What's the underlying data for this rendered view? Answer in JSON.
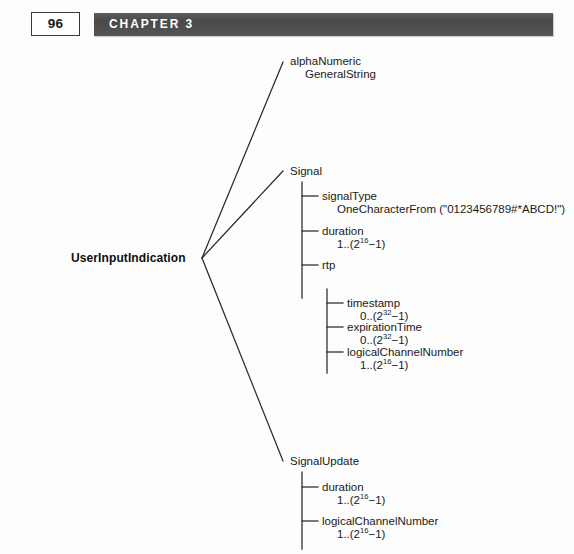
{
  "page": {
    "folio": "96",
    "chapter": "CHAPTER 3",
    "bar_color": "#4f4f4f",
    "background": "#fdfdfd",
    "ink": "#1a1a1a"
  },
  "tree": {
    "root": {
      "label": "UserInputIndication"
    },
    "branches": [
      {
        "name": "alphaNumeric",
        "label": "alphaNumeric",
        "value": "GeneralString"
      },
      {
        "name": "signal",
        "label": "Signal",
        "children": [
          {
            "name": "signalType",
            "label": "signalType",
            "value": "OneCharacterFrom (\"0123456789#*ABCD!\")"
          },
          {
            "name": "duration",
            "label": "duration",
            "value_prefix": "1..(2",
            "value_exp": "16",
            "value_suffix": "−1)"
          },
          {
            "name": "rtp",
            "label": "rtp",
            "children": [
              {
                "name": "timestamp",
                "label": "timestamp",
                "value_prefix": "0..(2",
                "value_exp": "32",
                "value_suffix": "−1)"
              },
              {
                "name": "expirationTime",
                "label": "expirationTime",
                "value_prefix": "0..(2",
                "value_exp": "32",
                "value_suffix": "−1)"
              },
              {
                "name": "logicalChannelNumber",
                "label": "logicalChannelNumber",
                "value_prefix": "1..(2",
                "value_exp": "16",
                "value_suffix": "−1)"
              }
            ]
          }
        ]
      },
      {
        "name": "signalUpdate",
        "label": "SignalUpdate",
        "children": [
          {
            "name": "duration",
            "label": "duration",
            "value_prefix": "1..(2",
            "value_exp": "16",
            "value_suffix": "−1)"
          },
          {
            "name": "logicalChannelNumber",
            "label": "logicalChannelNumber",
            "value_prefix": "1..(2",
            "value_exp": "16",
            "value_suffix": "−1)"
          }
        ]
      }
    ]
  }
}
